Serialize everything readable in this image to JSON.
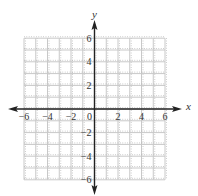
{
  "chart_data": {
    "type": "scatter",
    "title": "",
    "xlabel": "x",
    "ylabel": "y",
    "xlim": [
      -6,
      6
    ],
    "ylim": [
      -6,
      6
    ],
    "grid": true,
    "grid_step": 1,
    "x_ticks": [
      -6,
      -4,
      -2,
      0,
      2,
      4,
      6
    ],
    "x_tick_labels": [
      "−6",
      "−4",
      "−2",
      "0",
      "2",
      "4",
      "6"
    ],
    "y_ticks": [
      6,
      4,
      2,
      -2,
      -4,
      -6
    ],
    "y_tick_labels": [
      "6",
      "4",
      "2",
      "−2",
      "−4",
      "−6"
    ],
    "series": [],
    "legend": null
  },
  "style": {
    "axis_color": "#222222",
    "grid_color": "#c8c8c8",
    "grid_dot_color": "#9a9a9a",
    "label_color": "#333333"
  }
}
